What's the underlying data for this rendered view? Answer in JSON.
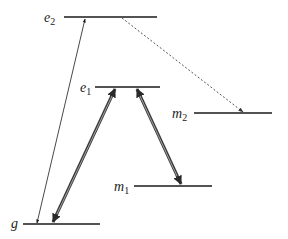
{
  "diagram": {
    "type": "energy-level-diagram",
    "colors": {
      "line": "#1a1a1a",
      "double_arrow_outer": "#3a3a3a",
      "double_arrow_inner": "#bdbdbd",
      "thin_arrow": "#1a1a1a",
      "dotted_arrow": "#555555"
    },
    "levels": [
      {
        "id": "e2",
        "base": "e",
        "sub": "2"
      },
      {
        "id": "e1",
        "base": "e",
        "sub": "1"
      },
      {
        "id": "m2",
        "base": "m",
        "sub": "2"
      },
      {
        "id": "m1",
        "base": "m",
        "sub": "1"
      },
      {
        "id": "g",
        "base": "g",
        "sub": ""
      }
    ],
    "transitions": [
      {
        "id": "g-e2",
        "from": "g",
        "to": "e2",
        "style": "thin",
        "direction": "bidirectional"
      },
      {
        "id": "g-e1",
        "from": "g",
        "to": "e1",
        "style": "double",
        "direction": "bidirectional"
      },
      {
        "id": "e1-m1",
        "from": "e1",
        "to": "m1",
        "style": "double",
        "direction": "bidirectional"
      },
      {
        "id": "e2-m2",
        "from": "e2",
        "to": "m2",
        "style": "dotted",
        "direction": "forward"
      }
    ]
  }
}
